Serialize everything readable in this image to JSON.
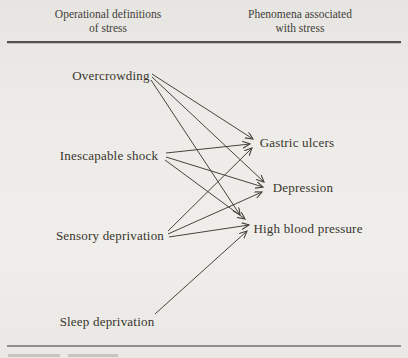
{
  "headers": {
    "left": {
      "line1": "Operational definitions",
      "line2": "of stress"
    },
    "right": {
      "line1": "Phenomena associated",
      "line2": "with stress"
    }
  },
  "colors": {
    "background": "#ecebe7",
    "text": "#38342d",
    "arrow": "#47433c",
    "top_rule": "#54524e",
    "bottom_rule": "#8f8e8b"
  },
  "diagram": {
    "type": "bipartite-arrow-diagram",
    "nodes": [
      {
        "id": "overcrowding",
        "label": "Overcrowding",
        "x": 111,
        "y": 76,
        "column": "left"
      },
      {
        "id": "inescapable-shock",
        "label": "Inescapable shock",
        "x": 109,
        "y": 156,
        "column": "left"
      },
      {
        "id": "sensory-deprivation",
        "label": "Sensory deprivation",
        "x": 110,
        "y": 236,
        "column": "left"
      },
      {
        "id": "sleep-deprivation",
        "label": "Sleep deprivation",
        "x": 107,
        "y": 322,
        "column": "left"
      },
      {
        "id": "gastric-ulcers",
        "label": "Gastric ulcers",
        "x": 297,
        "y": 143,
        "column": "right"
      },
      {
        "id": "depression",
        "label": "Depression",
        "x": 303,
        "y": 188,
        "column": "right"
      },
      {
        "id": "high-blood-pressure",
        "label": "High blood pressure",
        "x": 308,
        "y": 229,
        "column": "right"
      }
    ],
    "edges": [
      {
        "from": "overcrowding",
        "to": "gastric-ulcers",
        "x1": 152,
        "y1": 74,
        "x2": 253,
        "y2": 139
      },
      {
        "from": "overcrowding",
        "to": "depression",
        "x1": 152,
        "y1": 77,
        "x2": 264,
        "y2": 182
      },
      {
        "from": "overcrowding",
        "to": "high-blood-pressure",
        "x1": 151,
        "y1": 80,
        "x2": 240,
        "y2": 215
      },
      {
        "from": "inescapable-shock",
        "to": "gastric-ulcers",
        "x1": 166,
        "y1": 153,
        "x2": 250,
        "y2": 144
      },
      {
        "from": "inescapable-shock",
        "to": "depression",
        "x1": 166,
        "y1": 157,
        "x2": 263,
        "y2": 187
      },
      {
        "from": "inescapable-shock",
        "to": "high-blood-pressure",
        "x1": 165,
        "y1": 160,
        "x2": 245,
        "y2": 219
      },
      {
        "from": "sensory-deprivation",
        "to": "gastric-ulcers",
        "x1": 168,
        "y1": 231,
        "x2": 252,
        "y2": 148
      },
      {
        "from": "sensory-deprivation",
        "to": "depression",
        "x1": 168,
        "y1": 234,
        "x2": 262,
        "y2": 192
      },
      {
        "from": "sensory-deprivation",
        "to": "high-blood-pressure",
        "x1": 169,
        "y1": 237,
        "x2": 249,
        "y2": 225
      },
      {
        "from": "sleep-deprivation",
        "to": "high-blood-pressure",
        "x1": 155,
        "y1": 314,
        "x2": 247,
        "y2": 231
      }
    ]
  }
}
